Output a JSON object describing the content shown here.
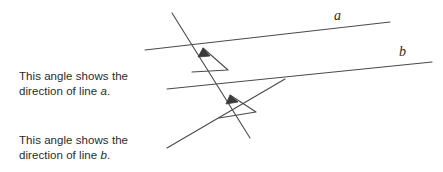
{
  "figure": {
    "background_color": "#ffffff",
    "stroke_color": "#4a4a4a",
    "text_color": "#2b2b2b",
    "width": 443,
    "height": 172
  },
  "labels": {
    "line_a": "a",
    "line_b": "b"
  },
  "captions": {
    "a": {
      "line1": "This angle shows the",
      "line2_prefix": "direction of line ",
      "line2_italic": "a",
      "line2_suffix": "."
    },
    "b": {
      "line1": "This angle shows the",
      "line2_prefix": "direction of line ",
      "line2_italic": "b",
      "line2_suffix": "."
    }
  },
  "geometry": {
    "line_a": {
      "x1": 145,
      "y1": 50,
      "x2": 390,
      "y2": 22
    },
    "line_b": {
      "x1": 167,
      "y1": 89,
      "x2": 432,
      "y2": 62
    },
    "transversal_upper": {
      "x1": 172,
      "y1": 13,
      "x2": 250,
      "y2": 138
    },
    "transversal_lower": {
      "x1": 167,
      "y1": 148,
      "x2": 285,
      "y2": 79
    },
    "angle_marker_a": {
      "arrow_tip": {
        "x": 203,
        "y": 48
      },
      "arrow_tail": {
        "x": 228,
        "y": 70
      },
      "wedge_end": {
        "x": 192,
        "y": 72
      }
    },
    "angle_marker_b": {
      "arrow_tip": {
        "x": 230,
        "y": 95
      },
      "arrow_tail": {
        "x": 256,
        "y": 112
      },
      "wedge_end": {
        "x": 219,
        "y": 118
      }
    }
  }
}
